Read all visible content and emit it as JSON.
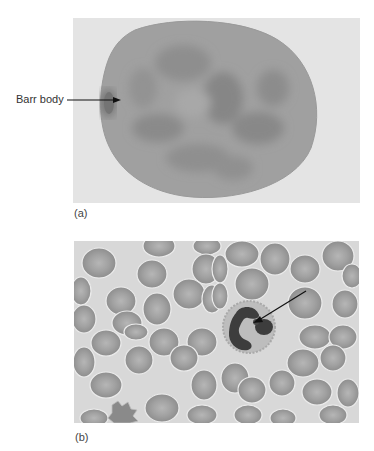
{
  "figure": {
    "panels": [
      {
        "id": "a",
        "label": "(a)",
        "description": "Interphase nucleus with Barr body at left edge",
        "annotation": {
          "text": "Barr body",
          "arrow": "pointing right to dark spot at nuclear edge"
        }
      },
      {
        "id": "b",
        "label": "(b)",
        "description": "Blood smear with red blood cells and a neutrophil with drumstick",
        "annotation": {
          "arrow": "pointing to drumstick appendage on neutrophil nucleus"
        }
      }
    ]
  },
  "colors": {
    "panel_a_background": "#e6e6e6",
    "nucleus": "#9c9c9c",
    "nucleus_dark": "#828282",
    "barr_body": "#6a6a6a",
    "panel_b_background": "#d9d9d9",
    "rbc": "#9e9e9e",
    "rbc_center": "#b4b4b4",
    "neutrophil_cytoplasm": "#b9b9b9",
    "neutrophil_nucleus": "#3c3c3c"
  }
}
